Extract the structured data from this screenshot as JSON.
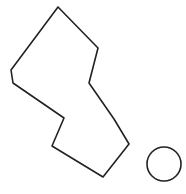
{
  "canvas": {
    "width": 186,
    "height": 194,
    "background": "#ffffff"
  },
  "shapes": {
    "polygon": {
      "points": "58,7 98,48 89,83 114,119 129,144 103,177 52,146 64,118 13,83 11,70",
      "stroke": "#222222",
      "stroke_width": 1.6,
      "fill": "none"
    },
    "circle": {
      "cx": 164,
      "cy": 164,
      "r": 17,
      "stroke": "#222222",
      "stroke_width": 1.6,
      "fill": "none"
    }
  }
}
